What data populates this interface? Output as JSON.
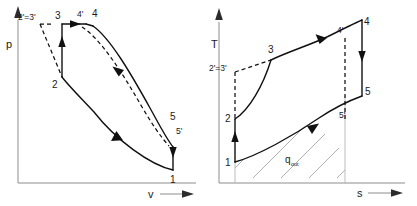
{
  "figure": {
    "type": "thermodynamic-cycle-diagram",
    "panel_count": 2,
    "line_color": "#111111",
    "axis_color": "#8d8d8d",
    "hatch_color": "#9a9a9a",
    "background": "#ffffff"
  },
  "pv_diagram": {
    "name": "pressure-volume-diagram",
    "y_axis_label": "p",
    "x_axis_label": "v",
    "state_labels": {
      "two_prime_three_prime": "2'=3'",
      "three": "3",
      "four_prime": "4'",
      "four": "4",
      "two": "2",
      "five": "5",
      "five_prime": "5'",
      "one": "1"
    }
  },
  "ts_diagram": {
    "name": "temperature-entropy-diagram",
    "y_axis_label": "T",
    "x_axis_label": "s",
    "state_labels": {
      "two_prime_three_prime": "2'=3'",
      "three": "3",
      "four_prime": "4'",
      "four": "4",
      "two": "2",
      "five": "5",
      "five_prime": "5'",
      "one": "1"
    },
    "area_label": {
      "symbol": "q",
      "subscript": "out"
    }
  }
}
